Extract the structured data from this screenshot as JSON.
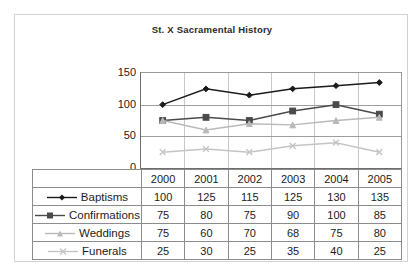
{
  "chart_data": {
    "type": "line",
    "title": "St. X Sacramental History",
    "xlabel": "",
    "ylabel": "",
    "categories": [
      "2000",
      "2001",
      "2002",
      "2003",
      "2004",
      "2005"
    ],
    "ylim": [
      0,
      150
    ],
    "yticks": [
      "0",
      "50",
      "100",
      "150"
    ],
    "grid": true,
    "legend_position": "table-left",
    "series": [
      {
        "name": "Baptisms",
        "values": [
          100,
          125,
          115,
          125,
          130,
          135
        ],
        "marker": "diamond",
        "color": "#1a1a1a"
      },
      {
        "name": "Confirmations",
        "values": [
          75,
          80,
          75,
          90,
          100,
          85
        ],
        "marker": "square",
        "color": "#4a4a4a"
      },
      {
        "name": "Weddings",
        "values": [
          75,
          60,
          70,
          68,
          75,
          80
        ],
        "marker": "triangle",
        "color": "#b9b9b9"
      },
      {
        "name": "Funerals",
        "values": [
          25,
          30,
          25,
          35,
          40,
          25
        ],
        "marker": "cross",
        "color": "#c4c4c4"
      }
    ]
  },
  "table": {
    "header_blank": "",
    "columns": [
      "2000",
      "2001",
      "2002",
      "2003",
      "2004",
      "2005"
    ],
    "rows": [
      {
        "label": "Baptisms",
        "values": [
          "100",
          "125",
          "115",
          "125",
          "130",
          "135"
        ]
      },
      {
        "label": "Confirmations",
        "values": [
          "75",
          "80",
          "75",
          "90",
          "100",
          "85"
        ]
      },
      {
        "label": "Weddings",
        "values": [
          "75",
          "60",
          "70",
          "68",
          "75",
          "80"
        ]
      },
      {
        "label": "Funerals",
        "values": [
          "25",
          "30",
          "25",
          "35",
          "40",
          "25"
        ]
      }
    ]
  },
  "colors": {
    "baptisms": "#1a1a1a",
    "confirmations": "#4a4a4a",
    "weddings": "#b9b9b9",
    "funerals": "#c4c4c4",
    "gridline": "#9e9e9e",
    "frame": "#d2d2d2",
    "table_border": "#8c8c8c"
  }
}
